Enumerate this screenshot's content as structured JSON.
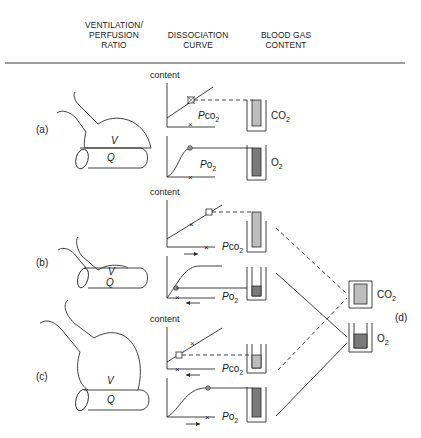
{
  "headers": {
    "vp_ratio": [
      "VENTILATION/",
      "PERFUSION",
      "RATIO"
    ],
    "dissociation": [
      "DISSOCIATION",
      "CURVE"
    ],
    "blood_gas": [
      "BLOOD GAS",
      "CONTENT"
    ]
  },
  "axis_label": "content",
  "alveolus_labels": {
    "ventilation": "V",
    "perfusion": "Q"
  },
  "gas_labels": {
    "pco2_prefix": "P",
    "pco2_main": "co",
    "pco2_sub": "2",
    "po2_prefix": "P",
    "po2_main": "o",
    "po2_sub": "2",
    "co2_main": "CO",
    "co2_sub": "2",
    "o2_main": "O",
    "o2_sub": "2"
  },
  "panels": [
    {
      "id": "a",
      "label": "(a)",
      "description": "normal V/Q"
    },
    {
      "id": "b",
      "label": "(b)",
      "description": "low V/Q"
    },
    {
      "id": "c",
      "label": "(c)",
      "description": "high V/Q"
    },
    {
      "id": "d",
      "label": "(d)",
      "description": "mixed blood gas content"
    }
  ],
  "colors": {
    "line": "#2a2a2a",
    "co2_fill": "#bdbdbd",
    "o2_fill": "#7a7a7a"
  }
}
